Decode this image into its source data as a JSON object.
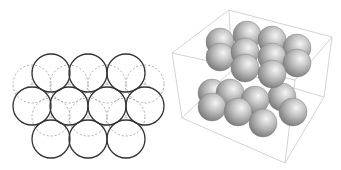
{
  "figure": {
    "left_panel": {
      "type": "2d-circle-packing",
      "radius": 19,
      "solid_circles": [
        {
          "cx": 51,
          "cy": 73
        },
        {
          "cx": 88,
          "cy": 73
        },
        {
          "cx": 126,
          "cy": 73
        },
        {
          "cx": 32,
          "cy": 106
        },
        {
          "cx": 69,
          "cy": 106
        },
        {
          "cx": 107,
          "cy": 106
        },
        {
          "cx": 145,
          "cy": 106
        },
        {
          "cx": 51,
          "cy": 139
        },
        {
          "cx": 88,
          "cy": 139
        },
        {
          "cx": 126,
          "cy": 139
        }
      ],
      "dashed_circles": [
        {
          "cx": 32,
          "cy": 84
        },
        {
          "cx": 69,
          "cy": 84
        },
        {
          "cx": 107,
          "cy": 84
        },
        {
          "cx": 145,
          "cy": 84
        },
        {
          "cx": 51,
          "cy": 117
        },
        {
          "cx": 88,
          "cy": 117
        },
        {
          "cx": 126,
          "cy": 117
        }
      ],
      "solid_color": "#333333",
      "dashed_color": "#aaaaaa"
    },
    "right_panel": {
      "type": "3d-sphere-packing",
      "box_color": "#c8c8c8",
      "box_edges": [
        [
          [
            59,
            10
          ],
          [
            162,
            37
          ]
        ],
        [
          [
            59,
            10
          ],
          [
            2,
            53
          ]
        ],
        [
          [
            2,
            53
          ],
          [
            12,
            118
          ]
        ],
        [
          [
            12,
            118
          ],
          [
            115,
            163
          ]
        ],
        [
          [
            115,
            163
          ],
          [
            154,
            97
          ]
        ],
        [
          [
            154,
            97
          ],
          [
            162,
            37
          ]
        ],
        [
          [
            2,
            53
          ],
          [
            125,
            80
          ]
        ],
        [
          [
            125,
            80
          ],
          [
            162,
            37
          ]
        ],
        [
          [
            125,
            80
          ],
          [
            115,
            163
          ]
        ],
        [
          [
            59,
            10
          ],
          [
            62,
            70
          ]
        ],
        [
          [
            62,
            70
          ],
          [
            12,
            118
          ]
        ],
        [
          [
            62,
            70
          ],
          [
            154,
            97
          ]
        ]
      ],
      "sphere_radius": 14,
      "spheres": [
        {
          "cx": 50,
          "cy": 42
        },
        {
          "cx": 77,
          "cy": 35
        },
        {
          "cx": 102,
          "cy": 40
        },
        {
          "cx": 127,
          "cy": 48
        },
        {
          "cx": 42,
          "cy": 93
        },
        {
          "cx": 60,
          "cy": 93
        },
        {
          "cx": 112,
          "cy": 97
        },
        {
          "cx": 50,
          "cy": 57
        },
        {
          "cx": 75,
          "cy": 52
        },
        {
          "cx": 102,
          "cy": 57
        },
        {
          "cx": 127,
          "cy": 63
        },
        {
          "cx": 85,
          "cy": 100
        },
        {
          "cx": 75,
          "cy": 68
        },
        {
          "cx": 102,
          "cy": 74
        },
        {
          "cx": 42,
          "cy": 107
        },
        {
          "cx": 68,
          "cy": 112
        },
        {
          "cx": 123,
          "cy": 112
        },
        {
          "cx": 93,
          "cy": 123
        }
      ]
    }
  }
}
